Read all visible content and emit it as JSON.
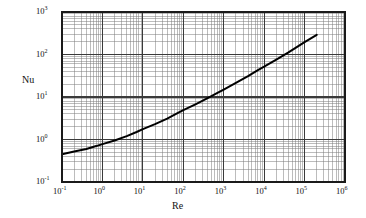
{
  "chart_data": {
    "type": "line",
    "title": "",
    "xlabel": "Re",
    "ylabel": "Nu",
    "xscale": "log",
    "yscale": "log",
    "xlim": [
      0.1,
      1000000
    ],
    "ylim": [
      0.1,
      1000
    ],
    "grid": true,
    "grid_minor": true,
    "legend": "none",
    "xticklabels": [
      "10-1",
      "100",
      "101",
      "102",
      "103",
      "104",
      "105",
      "106"
    ],
    "xtick_mantissas": [
      "10",
      "10",
      "10",
      "10",
      "10",
      "10",
      "10",
      "10"
    ],
    "xtick_exponents": [
      "-1",
      "0",
      "1",
      "2",
      "3",
      "4",
      "5",
      "6"
    ],
    "xticks": [
      0.1,
      1,
      10,
      100,
      1000,
      10000,
      100000,
      1000000
    ],
    "yticklabels": [
      "103",
      "102",
      "101",
      "100",
      "10-1"
    ],
    "ytick_mantissas": [
      "10",
      "10",
      "10",
      "10",
      "10"
    ],
    "ytick_exponents": [
      "3",
      "2",
      "1",
      "0",
      "-1"
    ],
    "yticks": [
      1000,
      100,
      10,
      1,
      0.1
    ],
    "series": [
      {
        "name": "Nu vs Re",
        "color": "#000000",
        "linewidth": 2.0,
        "x": [
          0.1,
          0.2,
          0.4,
          0.7,
          1,
          2,
          4,
          7,
          10,
          20,
          40,
          70,
          100,
          200,
          400,
          700,
          1000,
          2000,
          4000,
          7000,
          10000,
          20000,
          40000,
          70000,
          100000,
          200000
        ],
        "y": [
          0.45,
          0.52,
          0.6,
          0.7,
          0.78,
          0.95,
          1.2,
          1.5,
          1.75,
          2.3,
          3.1,
          4.1,
          4.9,
          6.7,
          9.4,
          12.5,
          15.0,
          21.5,
          31.0,
          43.0,
          52.0,
          76.0,
          112.0,
          158.0,
          195.0,
          290.0
        ]
      }
    ]
  },
  "axes": {
    "ylabel_text": "Nu",
    "xlabel_text": "Re"
  },
  "colors": {
    "curve": "#000000",
    "major_grid": "#3a3a3a",
    "minor_grid": "#7a7a7a",
    "frame": "#1a1a1a",
    "background": "#ffffff"
  }
}
